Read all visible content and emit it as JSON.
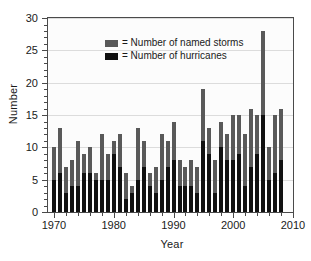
{
  "chart_data": {
    "type": "bar",
    "title": "",
    "xlabel": "Year",
    "ylabel": "Number",
    "xlim": [
      1969,
      2010
    ],
    "ylim": [
      0,
      30
    ],
    "grid": true,
    "stacked": true,
    "legend_position": "top-left",
    "y_ticks": [
      0,
      5,
      10,
      15,
      20,
      25,
      30
    ],
    "y_tick_labels": [
      "0",
      "5",
      "10",
      "15",
      "20",
      "25",
      "30"
    ],
    "y_minor_tick_step": 1,
    "x_ticks": [
      1970,
      1980,
      1990,
      2000,
      2010
    ],
    "x_tick_labels": [
      "1970",
      "1980",
      "1990",
      "2000",
      "2010"
    ],
    "x_minor_tick_step": 2,
    "categories": [
      1970,
      1971,
      1972,
      1973,
      1974,
      1975,
      1976,
      1977,
      1978,
      1979,
      1980,
      1981,
      1982,
      1983,
      1984,
      1985,
      1986,
      1987,
      1988,
      1989,
      1990,
      1991,
      1992,
      1993,
      1994,
      1995,
      1996,
      1997,
      1998,
      1999,
      2000,
      2001,
      2002,
      2003,
      2004,
      2005,
      2006,
      2007,
      2008
    ],
    "series": [
      {
        "name": "Number of named storms",
        "color": "#595959",
        "values": [
          10,
          13,
          7,
          8,
          11,
          9,
          10,
          6,
          12,
          9,
          11,
          12,
          6,
          4,
          13,
          11,
          6,
          7,
          12,
          11,
          14,
          8,
          7,
          8,
          7,
          19,
          13,
          8,
          14,
          12,
          15,
          15,
          12,
          16,
          15,
          28,
          10,
          15,
          16
        ]
      },
      {
        "name": "Number of hurricanes",
        "color": "#101010",
        "values": [
          5,
          6,
          3,
          4,
          4,
          6,
          6,
          5,
          5,
          5,
          9,
          7,
          2,
          3,
          5,
          7,
          4,
          3,
          5,
          7,
          8,
          4,
          4,
          4,
          3,
          11,
          9,
          3,
          10,
          8,
          8,
          9,
          4,
          7,
          9,
          15,
          5,
          6,
          8
        ]
      }
    ]
  },
  "legend": {
    "entries": [
      {
        "prefix": "=",
        "label": "= Number of named storms",
        "swatch_name": "legend-swatch-named-storms"
      },
      {
        "prefix": "=",
        "label": "= Number of hurricanes",
        "swatch_name": "legend-swatch-hurricanes"
      }
    ]
  },
  "colors": {
    "named_storms": "#595959",
    "hurricanes": "#101010",
    "axis": "#4a4a4a",
    "grid": "#dcdcdc",
    "plot_background": "#fcfcfc",
    "page_background": "#ffffff",
    "text": "#1a1a1a"
  }
}
